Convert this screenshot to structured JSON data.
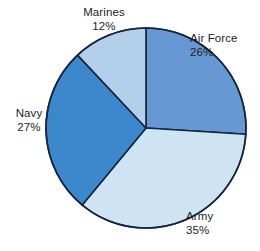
{
  "chart_data": {
    "type": "pie",
    "title": "",
    "subtitle": "",
    "xlabel": "",
    "ylabel": "",
    "legend_position": "none",
    "grid": false,
    "units": "percent",
    "start_angle_deg": 0,
    "direction": "clockwise",
    "total": 100,
    "categories": [
      "Air Force",
      "Army",
      "Navy",
      "Marines"
    ],
    "values": [
      26,
      35,
      27,
      12
    ],
    "slices": [
      {
        "label": "Air Force",
        "value": 26,
        "value_text": "26%",
        "color": "#6699d4",
        "start_deg": 0,
        "end_deg": 93.6,
        "label_position": "right"
      },
      {
        "label": "Army",
        "value": 35,
        "value_text": "35%",
        "color": "#cfe4f2",
        "start_deg": 93.6,
        "end_deg": 219.6,
        "label_position": "bottom-right"
      },
      {
        "label": "Navy",
        "value": 27,
        "value_text": "27%",
        "color": "#3d87cc",
        "start_deg": 219.6,
        "end_deg": 316.8,
        "label_position": "left"
      },
      {
        "label": "Marines",
        "value": 12,
        "value_text": "12%",
        "color": "#b3cfea",
        "start_deg": 316.8,
        "end_deg": 360,
        "label_position": "top"
      }
    ],
    "geometry": {
      "center_x": 146,
      "center_y": 128,
      "radius": 100
    },
    "style": {
      "background": "#ffffff",
      "outline_color": "#15253f",
      "text_color": "#1d1d1d"
    }
  }
}
